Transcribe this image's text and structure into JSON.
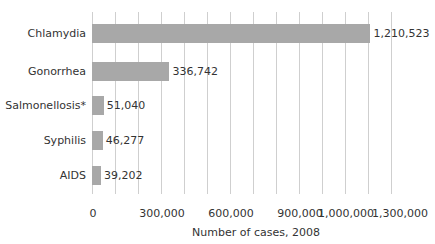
{
  "chart_data": {
    "type": "bar",
    "orientation": "horizontal",
    "title": "",
    "xlabel": "Number of cases, 2008",
    "ylabel": "",
    "categories": [
      "Chlamydia",
      "Gonorrhea",
      "Salmonellosis*",
      "Syphilis",
      "AIDS"
    ],
    "values": [
      1210523,
      336742,
      51040,
      46277,
      39202
    ],
    "value_labels": [
      "1,210,523",
      "336,742",
      "51,040",
      "46,277",
      "39,202"
    ],
    "x_ticks": [
      {
        "value": 0,
        "label": "0"
      },
      {
        "value": 300000,
        "label": "300,000"
      },
      {
        "value": 600000,
        "label": "600,000"
      },
      {
        "value": 900000,
        "label": "900,000"
      },
      {
        "value": 1000000,
        "label": "1,000,000"
      },
      {
        "value": 1300000,
        "label": "1,300,000"
      }
    ],
    "xlim": [
      0,
      1300000
    ],
    "gridlines_every": 100000,
    "grid": true,
    "legend": null,
    "bar_color": "#a8a8a8",
    "grid_color": "#cfcfcf"
  }
}
